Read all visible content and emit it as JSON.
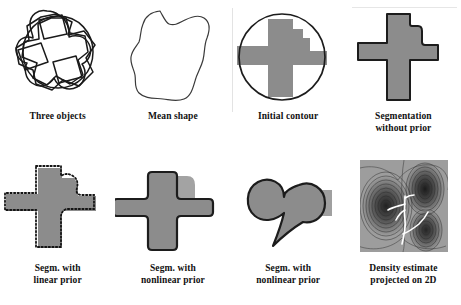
{
  "figure": {
    "panels": [
      {
        "id": "three-objects",
        "caption": "Three objects",
        "art": "three-overlapping-shape-outlines"
      },
      {
        "id": "mean-shape",
        "caption": "Mean shape",
        "art": "single-smooth-blob-outline"
      },
      {
        "id": "initial-contour",
        "caption": "Initial contour",
        "art": "gray-cross-with-circle-contour"
      },
      {
        "id": "segmentation-without-prior",
        "caption": "Segmentation\nwithout prior",
        "art": "gray-cross-outlined"
      },
      {
        "id": "segm-linear-prior",
        "caption": "Segm. with\nlinear prior",
        "art": "gray-cross-with-dotted-contour"
      },
      {
        "id": "segm-nonlinear-prior-1",
        "caption": "Segm. with\nnonlinear prior",
        "art": "clean-gray-cross"
      },
      {
        "id": "segm-nonlinear-prior-2",
        "caption": "Segm. with\nnonlinear prior",
        "art": "gray-heart-shape"
      },
      {
        "id": "density-estimate",
        "caption": "Density estimate\nprojected on 2D",
        "art": "density-contour-map-with-trajectories"
      }
    ]
  },
  "colors": {
    "shape_fill": "#8c8c8c",
    "shape_fill_light": "#9a9a9a",
    "outline": "#1c1c1c",
    "background": "#ffffff",
    "caption_text": "#111111",
    "density_background": "#9d9d9d",
    "density_trajectory": "#ffffff"
  }
}
